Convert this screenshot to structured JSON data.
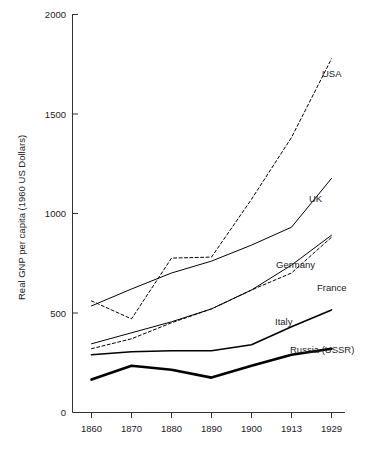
{
  "chart_data": {
    "type": "line",
    "title": "",
    "subtitle": "",
    "xlabel": "",
    "ylabel": "Real GNP per capita (1960 US Dollars)",
    "x": [
      1860,
      1870,
      1880,
      1890,
      1900,
      1913,
      1929
    ],
    "xtick_labels": [
      "1860",
      "1870",
      "1880",
      "1890",
      "1900",
      "1913",
      "1929"
    ],
    "ytick_labels": [
      "0",
      "500",
      "1000",
      "1500",
      "2000"
    ],
    "yticks": [
      0,
      500,
      1000,
      1500,
      2000
    ],
    "ylim": [
      0,
      2000
    ],
    "grid": false,
    "legend_position": "inline-annotations",
    "series": [
      {
        "name": "USA",
        "label": "USA",
        "style": "dashed",
        "width": 1.0,
        "values": [
          560,
          470,
          775,
          780,
          1070,
          1380,
          1775
        ]
      },
      {
        "name": "UK",
        "label": "UK",
        "style": "solid",
        "width": 1.0,
        "values": [
          535,
          620,
          700,
          760,
          840,
          930,
          1175
        ]
      },
      {
        "name": "Germany",
        "label": "Germany",
        "style": "solid",
        "width": 1.0,
        "values": [
          345,
          400,
          455,
          520,
          615,
          740,
          890
        ]
      },
      {
        "name": "France",
        "label": "France",
        "style": "dashed",
        "width": 1.0,
        "values": [
          320,
          370,
          450,
          520,
          615,
          700,
          880
        ]
      },
      {
        "name": "Italy",
        "label": "Italy",
        "style": "solid",
        "width": 1.6,
        "values": [
          290,
          305,
          310,
          310,
          340,
          430,
          515
        ]
      },
      {
        "name": "Russia (USSR)",
        "label": "Russia (USSR)",
        "style": "solid",
        "width": 2.6,
        "values": [
          165,
          235,
          215,
          175,
          235,
          290,
          320
        ]
      }
    ],
    "annotations": [
      {
        "text": "USA",
        "series": "USA",
        "x_px": 322,
        "y_px": 77
      },
      {
        "text": "UK",
        "series": "UK",
        "x_px": 309,
        "y_px": 202
      },
      {
        "text": "Germany",
        "series": "Germany",
        "x_px": 276,
        "y_px": 268
      },
      {
        "text": "France",
        "series": "France",
        "x_px": 317,
        "y_px": 291
      },
      {
        "text": "Italy",
        "series": "Italy",
        "x_px": 275,
        "y_px": 325
      },
      {
        "text": "Russia (USSR)",
        "series": "Russia (USSR)",
        "x_px": 290,
        "y_px": 353
      }
    ]
  }
}
